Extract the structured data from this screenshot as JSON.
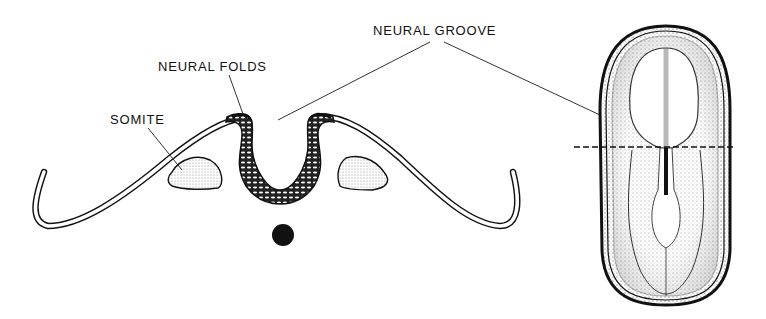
{
  "diagram": {
    "labels": {
      "neural_groove": "NEURAL GROOVE",
      "neural_folds": "NEURAL FOLDS",
      "somite": "SOMITE"
    },
    "parts": [
      {
        "id": "ectoderm-left",
        "desc": "double-line ectoderm curving left"
      },
      {
        "id": "ectoderm-right",
        "desc": "double-line ectoderm curving right"
      },
      {
        "id": "neural-plate",
        "desc": "stippled U-shaped neural plate / folds"
      },
      {
        "id": "somite-left",
        "desc": "stippled somite left"
      },
      {
        "id": "somite-right",
        "desc": "stippled somite right"
      },
      {
        "id": "notochord",
        "desc": "solid black circle"
      },
      {
        "id": "embryo-dorsal-view",
        "desc": "dorsal view of embryo with section line"
      }
    ],
    "colors": {
      "ink": "#111111",
      "stipple": "#cfcfcf",
      "background": "#ffffff"
    }
  }
}
